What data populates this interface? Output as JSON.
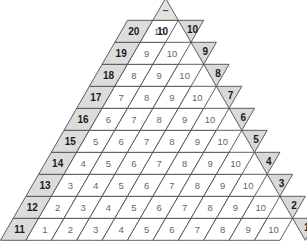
{
  "diagram": {
    "apex_symbol": "–",
    "apex_value": "10",
    "rows": 10,
    "colors": {
      "shade_left": "#dcdcdc",
      "shade_right": "#d9d9d9",
      "cell_fill": "#ffffff",
      "stroke": "#4d4d4d",
      "number_grey": "#666666",
      "number_bold": "#1a1a1a"
    },
    "row_data": [
      {
        "left_label": "20",
        "cells": [
          "10"
        ],
        "right_label": "10"
      },
      {
        "left_label": "19",
        "cells": [
          "9",
          "10"
        ],
        "right_label": "9"
      },
      {
        "left_label": "18",
        "cells": [
          "8",
          "9",
          "10"
        ],
        "right_label": "8"
      },
      {
        "left_label": "17",
        "cells": [
          "7",
          "8",
          "9",
          "10"
        ],
        "right_label": "7"
      },
      {
        "left_label": "16",
        "cells": [
          "6",
          "7",
          "8",
          "9",
          "10"
        ],
        "right_label": "6"
      },
      {
        "left_label": "15",
        "cells": [
          "5",
          "6",
          "7",
          "8",
          "9",
          "10"
        ],
        "right_label": "5"
      },
      {
        "left_label": "14",
        "cells": [
          "4",
          "5",
          "6",
          "7",
          "8",
          "9",
          "10"
        ],
        "right_label": "4"
      },
      {
        "left_label": "13",
        "cells": [
          "3",
          "4",
          "5",
          "6",
          "7",
          "8",
          "9",
          "10"
        ],
        "right_label": "3"
      },
      {
        "left_label": "12",
        "cells": [
          "2",
          "3",
          "4",
          "5",
          "6",
          "7",
          "8",
          "9",
          "10"
        ],
        "right_label": "2"
      },
      {
        "left_label": "11",
        "cells": [
          "1",
          "2",
          "3",
          "4",
          "5",
          "6",
          "7",
          "8",
          "9",
          "10"
        ],
        "right_label": "1"
      }
    ]
  }
}
